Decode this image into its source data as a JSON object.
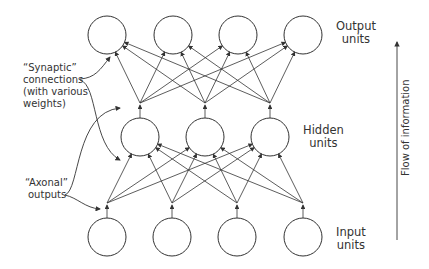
{
  "labels": {
    "output": [
      "Output",
      "units"
    ],
    "hidden": [
      "Hidden",
      "units"
    ],
    "input": [
      "Input",
      "units"
    ],
    "synaptic": [
      "“Synaptic”",
      "connections",
      "(with various",
      " weights)"
    ],
    "axonal": [
      "“Axonal”",
      "outputs"
    ],
    "flow": "Flow of information"
  },
  "layers": {
    "output": {
      "count": 4,
      "x": [
        107,
        173,
        238,
        303
      ],
      "y": 35
    },
    "hidden": {
      "count": 3,
      "x": [
        140,
        205,
        270
      ],
      "y": 137
    },
    "input": {
      "count": 4,
      "x": [
        107,
        172,
        237,
        303
      ],
      "y": 237
    }
  },
  "colors": {
    "stroke": "#333333",
    "background": "#ffffff"
  }
}
